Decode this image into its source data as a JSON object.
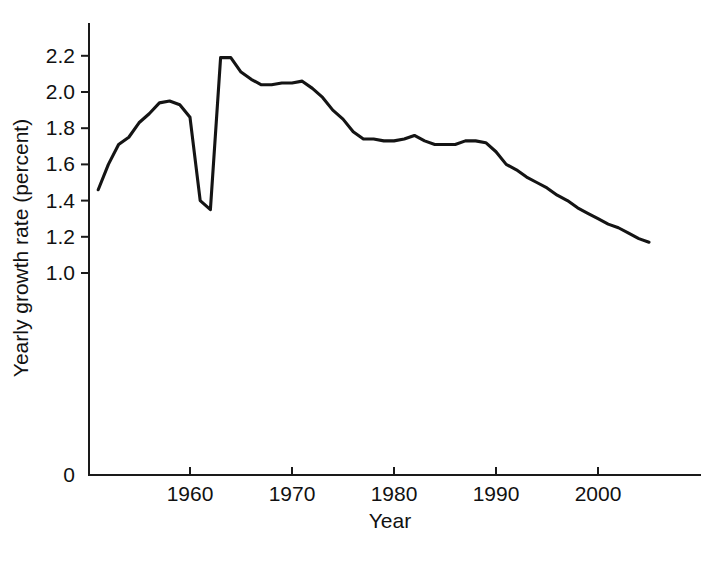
{
  "chart_data": {
    "type": "line",
    "title": "",
    "xlabel": "Year",
    "ylabel": "Yearly growth rate (percent)",
    "xlim": [
      1951,
      2005
    ],
    "ylim": [
      0,
      2.3
    ],
    "grid": false,
    "legend": "none",
    "line_color": "#141414",
    "x_ticks": [
      "1960",
      "1970",
      "1980",
      "1990",
      "2000"
    ],
    "x_tick_values": [
      1960,
      1970,
      1980,
      1990,
      2000
    ],
    "y_ticks": [
      "0",
      "1.0",
      "1.2",
      "1.4",
      "1.6",
      "1.8",
      "2.0",
      "2.2"
    ],
    "y_tick_values": [
      0,
      1.0,
      1.2,
      1.4,
      1.6,
      1.8,
      2.0,
      2.2
    ],
    "y_axis_note": "axis broken between 0 and 1.0",
    "series": [
      {
        "name": "World yearly population growth rate",
        "x": [
          1951,
          1952,
          1953,
          1954,
          1955,
          1956,
          1957,
          1958,
          1959,
          1960,
          1961,
          1962,
          1963,
          1964,
          1965,
          1966,
          1967,
          1968,
          1969,
          1970,
          1971,
          1972,
          1973,
          1974,
          1975,
          1976,
          1977,
          1978,
          1979,
          1980,
          1981,
          1982,
          1983,
          1984,
          1985,
          1986,
          1987,
          1988,
          1989,
          1990,
          1991,
          1992,
          1993,
          1994,
          1995,
          1996,
          1997,
          1998,
          1999,
          2000,
          2001,
          2002,
          2003,
          2004,
          2005
        ],
        "values": [
          1.46,
          1.6,
          1.71,
          1.75,
          1.83,
          1.88,
          1.94,
          1.95,
          1.93,
          1.86,
          1.4,
          1.35,
          2.19,
          2.19,
          2.11,
          2.07,
          2.04,
          2.04,
          2.05,
          2.05,
          2.06,
          2.02,
          1.97,
          1.9,
          1.85,
          1.78,
          1.74,
          1.74,
          1.73,
          1.73,
          1.74,
          1.76,
          1.73,
          1.71,
          1.71,
          1.71,
          1.73,
          1.73,
          1.72,
          1.67,
          1.6,
          1.57,
          1.53,
          1.5,
          1.47,
          1.43,
          1.4,
          1.36,
          1.33,
          1.3,
          1.27,
          1.25,
          1.22,
          1.19,
          1.17
        ]
      }
    ]
  },
  "axes": {
    "x_title": "Year",
    "y_title": "Yearly growth rate (percent)"
  }
}
